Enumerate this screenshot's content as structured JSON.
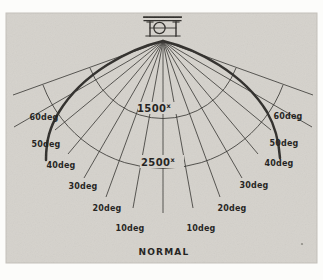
{
  "colors": {
    "page_bg": "#fcfcfa",
    "photo_bg": "#d5d2cc",
    "photo_edge": "#c3c0ba",
    "ink": "#2e2c29",
    "text": "#1d1c1a"
  },
  "labels": {
    "left": [
      "60deg",
      "50deg",
      "40deg",
      "30deg",
      "20deg",
      "10deg"
    ],
    "right": [
      "60deg",
      "50deg",
      "40deg",
      "30deg",
      "20deg",
      "10deg"
    ],
    "normal": "NORMAL",
    "isolux": [
      {
        "value": "1500",
        "superscript": "x"
      },
      {
        "value": "2500",
        "superscript": "x"
      }
    ]
  },
  "diagram": {
    "type": "polar-photometric-fan",
    "description_visible_content": "Light source fixture at top with rays fanning down from the normal, two isolux arcs crossing the rays, heavy intensity-distribution curve bulging to both sides",
    "ray_angles_deg": [
      0,
      10,
      20,
      30,
      40,
      50,
      60,
      70
    ],
    "labeled_angles_deg": [
      10,
      20,
      30,
      40,
      50,
      60
    ],
    "isolux_contour_values": [
      1500,
      2500
    ],
    "baseline_label": "NORMAL"
  }
}
